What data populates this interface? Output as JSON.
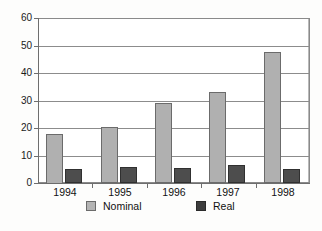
{
  "chart_data": {
    "type": "bar",
    "title": "",
    "subtitle": "",
    "xlabel": "",
    "ylabel": "",
    "categories": [
      "1994",
      "1995",
      "1996",
      "1997",
      "1998"
    ],
    "series": [
      {
        "name": "Nominal",
        "color": "#b0b0b0",
        "values": [
          18,
          20.5,
          29,
          33,
          47.5
        ]
      },
      {
        "name": "Real",
        "color": "#4d4d4d",
        "values": [
          5,
          5.7,
          5.6,
          6.5,
          5.2
        ]
      }
    ],
    "ylim": [
      0,
      60
    ],
    "ytick_step": 10,
    "yticks": [
      "0",
      "10",
      "20",
      "30",
      "40",
      "50",
      "60"
    ],
    "grid": true,
    "grid_axis": "y",
    "legend_position": "bottom",
    "legend": [
      "Nominal",
      "Real"
    ],
    "annotations": []
  },
  "axes": {
    "y_tick_labels": [
      "60",
      "50",
      "40",
      "30",
      "20",
      "10",
      "0"
    ],
    "x_tick_labels": [
      "1994",
      "1995",
      "1996",
      "1997",
      "1998"
    ]
  },
  "legend": {
    "items": [
      {
        "label": "Nominal",
        "swatch": "light-gray-square"
      },
      {
        "label": "Real",
        "swatch": "dark-gray-square"
      }
    ]
  },
  "colors": {
    "nominal": "#b0b0b0",
    "real": "#4d4d4d",
    "axis": "#6e6e6e",
    "grid": "#8c8c8c",
    "background": "#ffffff"
  }
}
